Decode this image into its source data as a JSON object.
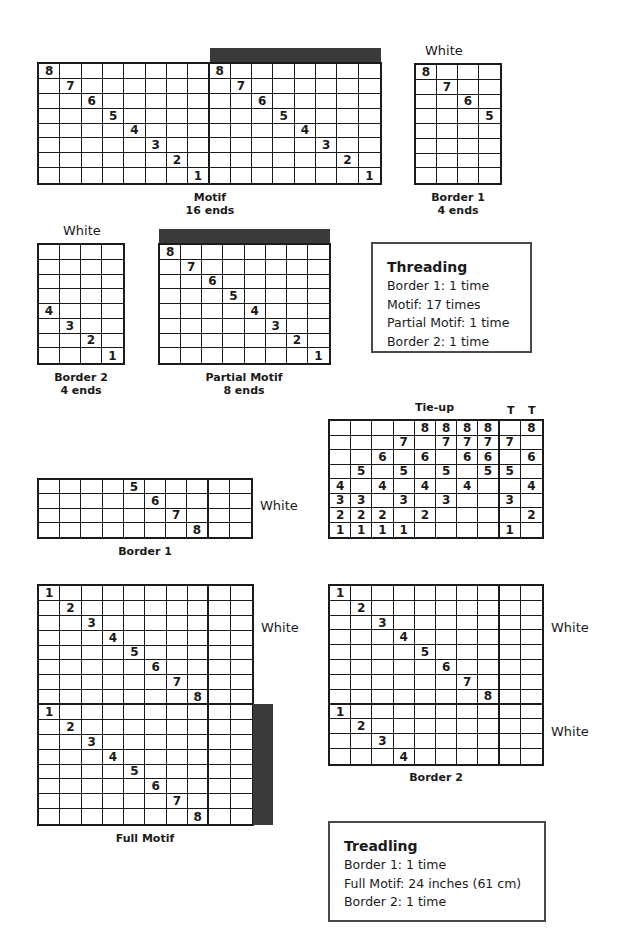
{
  "threading_drafts": {
    "motif": {
      "label": "Motif",
      "ends": "16 ends",
      "cols": 16,
      "rows": 8,
      "marks": [
        [
          0,
          0,
          "8"
        ],
        [
          1,
          1,
          "7"
        ],
        [
          2,
          2,
          "6"
        ],
        [
          3,
          3,
          "5"
        ],
        [
          4,
          4,
          "4"
        ],
        [
          5,
          5,
          "3"
        ],
        [
          6,
          6,
          "2"
        ],
        [
          7,
          7,
          "1"
        ],
        [
          0,
          8,
          "8"
        ],
        [
          1,
          9,
          "7"
        ],
        [
          2,
          10,
          "6"
        ],
        [
          3,
          11,
          "5"
        ],
        [
          4,
          12,
          "4"
        ],
        [
          5,
          13,
          "3"
        ],
        [
          6,
          14,
          "2"
        ],
        [
          7,
          15,
          "1"
        ]
      ],
      "thick_col_after": 7
    },
    "border1": {
      "label": "Border 1",
      "ends": "4 ends",
      "color_label": "White",
      "cols": 4,
      "rows": 8,
      "marks": [
        [
          0,
          0,
          "8"
        ],
        [
          1,
          1,
          "7"
        ],
        [
          2,
          2,
          "6"
        ],
        [
          3,
          3,
          "5"
        ]
      ]
    },
    "border2": {
      "label": "Border 2",
      "ends": "4 ends",
      "color_label": "White",
      "cols": 4,
      "rows": 8,
      "marks": [
        [
          4,
          0,
          "4"
        ],
        [
          5,
          1,
          "3"
        ],
        [
          6,
          2,
          "2"
        ],
        [
          7,
          3,
          "1"
        ]
      ]
    },
    "partial_motif": {
      "label": "Partial Motif",
      "ends": "8 ends",
      "cols": 8,
      "rows": 8,
      "marks": [
        [
          0,
          0,
          "8"
        ],
        [
          1,
          1,
          "7"
        ],
        [
          2,
          2,
          "6"
        ],
        [
          3,
          3,
          "5"
        ],
        [
          4,
          4,
          "4"
        ],
        [
          5,
          5,
          "3"
        ],
        [
          6,
          6,
          "2"
        ],
        [
          7,
          7,
          "1"
        ]
      ]
    }
  },
  "threading_box": {
    "title": "Threading",
    "lines": [
      "Border 1: 1 time",
      "Motif: 17 times",
      "Partial Motif: 1 time",
      "Border 2: 1 time"
    ]
  },
  "tieup": {
    "label": "Tie-up",
    "tabby_labels": [
      "T",
      "T"
    ],
    "cols": 10,
    "rows": 8,
    "thick_col_after": 7,
    "grid": [
      [
        "",
        "",
        "",
        "",
        "8",
        "8",
        "8",
        "8",
        "",
        "8"
      ],
      [
        "",
        "",
        "",
        "7",
        "",
        "7",
        "7",
        "7",
        "7",
        ""
      ],
      [
        "",
        "",
        "6",
        "",
        "6",
        "",
        "6",
        "6",
        "",
        "6"
      ],
      [
        "",
        "5",
        "",
        "5",
        "",
        "5",
        "",
        "5",
        "5",
        ""
      ],
      [
        "4",
        "",
        "4",
        "",
        "4",
        "",
        "4",
        "",
        "",
        "4"
      ],
      [
        "3",
        "3",
        "",
        "3",
        "",
        "3",
        "",
        "",
        "3",
        ""
      ],
      [
        "2",
        "2",
        "2",
        "",
        "2",
        "",
        "",
        "",
        "",
        "2"
      ],
      [
        "1",
        "1",
        "1",
        "1",
        "",
        "",
        "",
        "",
        "1",
        ""
      ]
    ]
  },
  "treadling_drafts": {
    "border1": {
      "label": "Border 1",
      "color_label": "White",
      "cols": 10,
      "rows": 4,
      "thick_col_after": 7,
      "marks": [
        [
          0,
          4,
          "5"
        ],
        [
          1,
          5,
          "6"
        ],
        [
          2,
          6,
          "7"
        ],
        [
          3,
          7,
          "8"
        ]
      ]
    },
    "full_motif": {
      "label": "Full Motif",
      "color_label": "White",
      "cols": 10,
      "rows": 16,
      "thick_col_after": 7,
      "thick_row_after": 7,
      "marks": [
        [
          0,
          0,
          "1"
        ],
        [
          1,
          1,
          "2"
        ],
        [
          2,
          2,
          "3"
        ],
        [
          3,
          3,
          "4"
        ],
        [
          4,
          4,
          "5"
        ],
        [
          5,
          5,
          "6"
        ],
        [
          6,
          6,
          "7"
        ],
        [
          7,
          7,
          "8"
        ],
        [
          8,
          0,
          "1"
        ],
        [
          9,
          1,
          "2"
        ],
        [
          10,
          2,
          "3"
        ],
        [
          11,
          3,
          "4"
        ],
        [
          12,
          4,
          "5"
        ],
        [
          13,
          5,
          "6"
        ],
        [
          14,
          6,
          "7"
        ],
        [
          15,
          7,
          "8"
        ]
      ]
    },
    "border2": {
      "label": "Border 2",
      "color_labels": [
        "White",
        "White"
      ],
      "cols": 10,
      "rows": 12,
      "thick_col_after": 7,
      "thick_row_after": 7,
      "marks": [
        [
          0,
          0,
          "1"
        ],
        [
          1,
          1,
          "2"
        ],
        [
          2,
          2,
          "3"
        ],
        [
          3,
          3,
          "4"
        ],
        [
          4,
          4,
          "5"
        ],
        [
          5,
          5,
          "6"
        ],
        [
          6,
          6,
          "7"
        ],
        [
          7,
          7,
          "8"
        ],
        [
          8,
          0,
          "1"
        ],
        [
          9,
          1,
          "2"
        ],
        [
          10,
          2,
          "3"
        ],
        [
          11,
          3,
          "4"
        ]
      ]
    }
  },
  "treadling_box": {
    "title": "Treadling",
    "lines": [
      "Border 1: 1 time",
      "Full Motif: 24 inches (61 cm)",
      "Border 2: 1 time"
    ]
  },
  "colors": {
    "line": "#1a1a1a",
    "bar": "#3a3a3a",
    "box_border": "#4a4a4a"
  }
}
